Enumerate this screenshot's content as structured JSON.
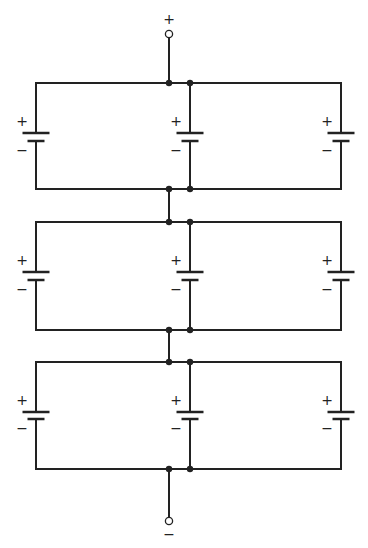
{
  "diagram": {
    "type": "circuit-schematic",
    "terminals": {
      "top": {
        "label": "+",
        "x": 169,
        "y": 34,
        "label_y": 20
      },
      "bottom": {
        "label": "−",
        "x": 169,
        "y": 521,
        "label_y": 535
      }
    },
    "rail_x": {
      "left": 36,
      "node_a": 169,
      "node_b": 190,
      "right": 341
    },
    "groups": [
      {
        "name": "group-1",
        "top_y": 83,
        "bottom_y": 189,
        "plate_long_y": 133,
        "plate_short_y": 141
      },
      {
        "name": "group-2",
        "top_y": 222,
        "bottom_y": 330,
        "plate_long_y": 272,
        "plate_short_y": 280
      },
      {
        "name": "group-3",
        "top_y": 362,
        "bottom_y": 469,
        "plate_long_y": 412,
        "plate_short_y": 419
      }
    ],
    "battery_columns": [
      36,
      190,
      341
    ],
    "battery_labels": {
      "positive": "+",
      "negative": "−"
    },
    "colors": {
      "line": "#222222",
      "background": "#ffffff"
    }
  }
}
